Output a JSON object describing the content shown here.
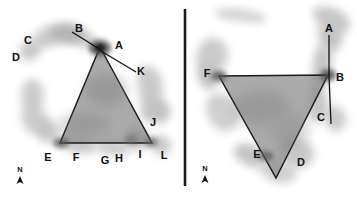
{
  "figure": {
    "title": "",
    "background_color": "#ffffff",
    "divider": {
      "name": "panel-divider",
      "x": 185,
      "y1": 9,
      "y2": 186,
      "color": "#1a1a1a",
      "width": 2.4
    },
    "colors": {
      "triangle_fill": "#8c8c8c",
      "triangle_stroke": "#1a1a1a",
      "blob_light": "#c9c9c9",
      "blob_mid": "#b0b0b0",
      "blob_dark": "#8f8f8f",
      "blob_darkest": "#4a4a4a",
      "label_text": "#111111",
      "pointer_line": "#101010"
    }
  },
  "panels": [
    {
      "name": "left-panel",
      "id": "left",
      "triangle": {
        "name": "triangle-left",
        "points": "100,47 152,143 60,143",
        "vertices": [
          {
            "label": "A",
            "x": 100,
            "y": 47
          },
          {
            "label": "I",
            "x": 152,
            "y": 143
          },
          {
            "label": "E",
            "x": 60,
            "y": 143
          }
        ]
      },
      "pointer_lines": [
        {
          "name": "pointer-B-to-A",
          "x1": 72,
          "y1": 32,
          "x2": 101,
          "y2": 50
        },
        {
          "name": "pointer-A-to-K",
          "x1": 101,
          "y1": 51,
          "x2": 136,
          "y2": 72
        }
      ],
      "labels": [
        {
          "text": "B",
          "x": 79,
          "y": 29,
          "name": "point-label-b"
        },
        {
          "text": "A",
          "x": 119,
          "y": 46,
          "name": "point-label-a"
        },
        {
          "text": "C",
          "x": 28,
          "y": 41,
          "name": "point-label-c"
        },
        {
          "text": "D",
          "x": 16,
          "y": 58,
          "name": "point-label-d"
        },
        {
          "text": "K",
          "x": 141,
          "y": 72,
          "name": "point-label-k"
        },
        {
          "text": "J",
          "x": 153,
          "y": 123,
          "name": "point-label-j"
        },
        {
          "text": "E",
          "x": 48,
          "y": 158,
          "name": "point-label-e"
        },
        {
          "text": "F",
          "x": 76,
          "y": 158,
          "name": "point-label-f"
        },
        {
          "text": "G",
          "x": 105,
          "y": 161,
          "name": "point-label-g"
        },
        {
          "text": "H",
          "x": 119,
          "y": 159,
          "name": "point-label-h"
        },
        {
          "text": "I",
          "x": 140,
          "y": 155,
          "name": "point-label-i"
        },
        {
          "text": "L",
          "x": 164,
          "y": 156,
          "name": "point-label-l"
        }
      ],
      "north_arrow": {
        "name": "north-arrow-left",
        "letter": "N",
        "letter_x": 20,
        "letter_y": 172,
        "arrow_x": 20,
        "arrow_y": 177
      }
    },
    {
      "name": "right-panel",
      "id": "right",
      "triangle": {
        "name": "triangle-right",
        "points": "219,76 328,75 276,178",
        "vertices": [
          {
            "label": "F",
            "x": 219,
            "y": 76
          },
          {
            "label": "B",
            "x": 328,
            "y": 75
          },
          {
            "label": "bottom",
            "x": 276,
            "y": 178
          }
        ]
      },
      "pointer_lines": [
        {
          "name": "pointer-A-to-B",
          "x1": 329,
          "y1": 35,
          "x2": 329,
          "y2": 76
        },
        {
          "name": "pointer-B-to-C",
          "x1": 329,
          "y1": 76,
          "x2": 331,
          "y2": 124
        }
      ],
      "labels": [
        {
          "text": "A",
          "x": 329,
          "y": 29,
          "name": "point-label-a"
        },
        {
          "text": "B",
          "x": 340,
          "y": 78,
          "name": "point-label-b"
        },
        {
          "text": "C",
          "x": 321,
          "y": 118,
          "name": "point-label-c"
        },
        {
          "text": "F",
          "x": 207,
          "y": 74,
          "name": "point-label-f"
        },
        {
          "text": "E",
          "x": 257,
          "y": 155,
          "name": "point-label-e"
        },
        {
          "text": "D",
          "x": 301,
          "y": 163,
          "name": "point-label-d"
        }
      ],
      "north_arrow": {
        "name": "north-arrow-right",
        "letter": "N",
        "letter_x": 205,
        "letter_y": 171,
        "arrow_x": 205,
        "arrow_y": 176
      }
    }
  ]
}
